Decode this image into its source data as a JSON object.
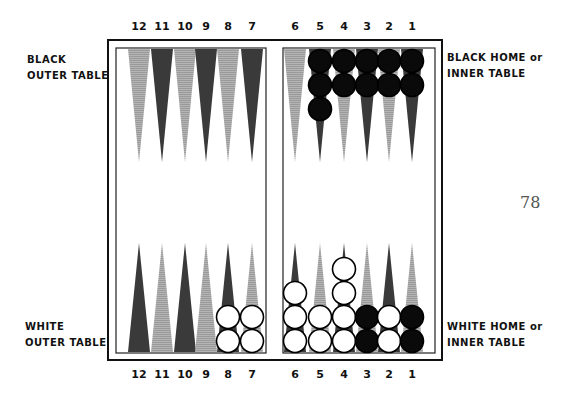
{
  "labels": {
    "black_outer": [
      "BLACK",
      "OUTER TABLE"
    ],
    "black_home": [
      "BLACK HOME or",
      "INNER TABLE"
    ],
    "white_outer": [
      "WHITE",
      "OUTER TABLE"
    ],
    "white_home": [
      "WHITE HOME or",
      "INNER TABLE"
    ]
  },
  "page_number": "78",
  "point_numbers_top": [
    "12",
    "11",
    "10",
    "9",
    "8",
    "7",
    "6",
    "5",
    "4",
    "3",
    "2",
    "1"
  ],
  "point_numbers_bottom": [
    "12",
    "11",
    "10",
    "9",
    "8",
    "7",
    "6",
    "5",
    "4",
    "3",
    "2",
    "1"
  ],
  "colors": {
    "dark_point": "#3a3a3a",
    "light_point": "#a8a8a8",
    "black_checker": "#0a0a0a",
    "white_checker": "#ffffff",
    "frame": "#111111"
  },
  "board": {
    "top_points": [
      {
        "point": "12",
        "shade": "light",
        "checkers": 0,
        "color": null
      },
      {
        "point": "11",
        "shade": "dark",
        "checkers": 0,
        "color": null
      },
      {
        "point": "10",
        "shade": "light",
        "checkers": 0,
        "color": null
      },
      {
        "point": "9",
        "shade": "dark",
        "checkers": 0,
        "color": null
      },
      {
        "point": "8",
        "shade": "light",
        "checkers": 0,
        "color": null
      },
      {
        "point": "7",
        "shade": "dark",
        "checkers": 0,
        "color": null
      },
      {
        "point": "6",
        "shade": "light",
        "checkers": 0,
        "color": null
      },
      {
        "point": "5",
        "shade": "dark",
        "checkers": 3,
        "color": "black"
      },
      {
        "point": "4",
        "shade": "light",
        "checkers": 2,
        "color": "black"
      },
      {
        "point": "3",
        "shade": "dark",
        "checkers": 2,
        "color": "black"
      },
      {
        "point": "2",
        "shade": "light",
        "checkers": 2,
        "color": "black"
      },
      {
        "point": "1",
        "shade": "dark",
        "checkers": 2,
        "color": "black"
      }
    ],
    "bottom_points": [
      {
        "point": "12",
        "shade": "dark",
        "checkers": 0,
        "color": null
      },
      {
        "point": "11",
        "shade": "light",
        "checkers": 0,
        "color": null
      },
      {
        "point": "10",
        "shade": "dark",
        "checkers": 0,
        "color": null
      },
      {
        "point": "9",
        "shade": "light",
        "checkers": 0,
        "color": null
      },
      {
        "point": "8",
        "shade": "dark",
        "checkers": 2,
        "color": "white"
      },
      {
        "point": "7",
        "shade": "light",
        "checkers": 2,
        "color": "white"
      },
      {
        "point": "6",
        "shade": "dark",
        "checkers": 3,
        "color": "white"
      },
      {
        "point": "5",
        "shade": "light",
        "checkers": 2,
        "color": "white"
      },
      {
        "point": "4",
        "shade": "dark",
        "checkers": 4,
        "color": "white"
      },
      {
        "point": "3",
        "shade": "light",
        "checkers": 2,
        "color": "black"
      },
      {
        "point": "2",
        "shade": "dark",
        "checkers": 2,
        "color": "white"
      },
      {
        "point": "1",
        "shade": "light",
        "checkers": 2,
        "color": "black"
      }
    ]
  }
}
